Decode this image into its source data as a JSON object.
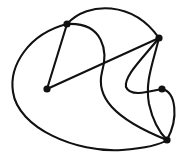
{
  "figure": {
    "title": "",
    "type": "graph-drawing",
    "width": 182,
    "height": 163,
    "background_color": "#ffffff",
    "stroke_color": "#111111",
    "vertex_color": "#111111",
    "stroke_width": 2.1,
    "vertex_radius": 3.6
  },
  "graph_data": {
    "type": "graph",
    "description": "Planar drawing of an undirected graph with five filled round vertices joined by a mix of straight-line and curved edges.",
    "vertex_count": 5,
    "edge_count": 8,
    "directed": false,
    "vertices": [
      {
        "id": "v1",
        "label": "",
        "x": 67,
        "y": 24,
        "degree": 4
      },
      {
        "id": "v2",
        "label": "",
        "x": 159,
        "y": 38,
        "degree": 4
      },
      {
        "id": "v3",
        "label": "",
        "x": 47,
        "y": 89,
        "degree": 2
      },
      {
        "id": "v4",
        "label": "",
        "x": 162,
        "y": 89,
        "degree": 2
      },
      {
        "id": "v5",
        "label": "",
        "x": 167,
        "y": 140,
        "degree": 4
      }
    ],
    "edges": [
      {
        "id": "e1",
        "source": "v1",
        "target": "v2",
        "style": "curved",
        "note": "top arc bulging upward",
        "path": "M 67 24 C 88 1 133 1 159 38"
      },
      {
        "id": "e2",
        "source": "v1",
        "target": "v3",
        "style": "straight",
        "note": "short straight segment",
        "path": "M 67 24 L 47 89"
      },
      {
        "id": "e3",
        "source": "v3",
        "target": "v2",
        "style": "straight",
        "note": "long diagonal straight chord",
        "path": "M 47 89 L 159 38"
      },
      {
        "id": "e4",
        "source": "v1",
        "target": "v5",
        "style": "curved",
        "note": "S-shaped curve descending through the middle",
        "path": "M 67 24 C 104 22 108 52 102 72 C 96 96 112 118 167 140"
      },
      {
        "id": "e5",
        "source": "v1",
        "target": "v5",
        "style": "curved",
        "note": "large outer sweep around the left and bottom",
        "path": "M 67 24 C 28 34 9 66 13 92 C 18 128 76 153 122 150 C 146 148 160 145 167 140"
      },
      {
        "id": "e6",
        "source": "v2",
        "target": "v4",
        "style": "curved",
        "note": "curve dropping from right vertex toward lower-left then back to v4",
        "path": "M 159 38 C 141 60 124 76 126 87 C 130 97 148 92 162 89"
      },
      {
        "id": "e7",
        "source": "v4",
        "target": "v5",
        "style": "curved",
        "note": "curve bowing right down to bottom vertex",
        "path": "M 162 89 C 176 92 179 118 167 140"
      },
      {
        "id": "e8",
        "source": "v2",
        "target": "v5",
        "style": "curved",
        "note": "inner curve hugging the right side",
        "path": "M 159 38 C 152 66 145 82 149 104 C 153 122 160 133 167 140"
      }
    ]
  }
}
